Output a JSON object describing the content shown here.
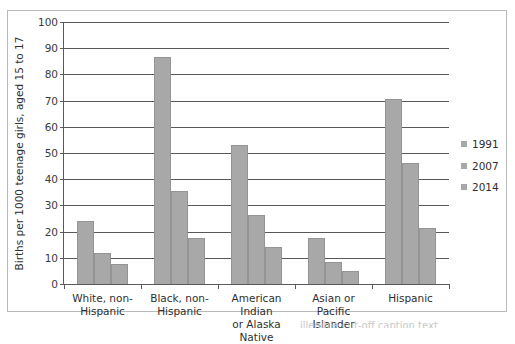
{
  "chart_data": {
    "type": "bar",
    "title": "",
    "xlabel": "",
    "ylabel": "Births per 1000 teenage girls, aged 15 to 17",
    "ylim": [
      0,
      100
    ],
    "ytick_labels": [
      "0",
      "10",
      "20",
      "30",
      "40",
      "50",
      "60",
      "70",
      "80",
      "90",
      "100"
    ],
    "ytick_values": [
      0,
      10,
      20,
      30,
      40,
      50,
      60,
      70,
      80,
      90,
      100
    ],
    "grid": "horizontal",
    "legend_position": "right",
    "bar_color": "#a8a8a8",
    "categories": [
      "White, non-Hispanic",
      "Black, non-Hispanic",
      "American Indian or Alaska Native",
      "Asian or Pacific Islander",
      "Hispanic"
    ],
    "category_lines": [
      [
        "White, non-",
        "Hispanic"
      ],
      [
        "Black, non-",
        "Hispanic"
      ],
      [
        "American Indian",
        "or Alaska Native"
      ],
      [
        "Asian or Pacific",
        "Islander"
      ],
      [
        "Hispanic"
      ]
    ],
    "series": [
      {
        "name": "1991",
        "values": [
          24,
          86.5,
          53,
          17.5,
          70.5
        ]
      },
      {
        "name": "2007",
        "values": [
          12,
          35.5,
          26.5,
          8.5,
          46
        ]
      },
      {
        "name": "2014",
        "values": [
          7.5,
          17.5,
          14,
          5,
          21.5
        ]
      }
    ]
  },
  "legend": {
    "items": [
      {
        "label": "1991"
      },
      {
        "label": "2007"
      },
      {
        "label": "2014"
      }
    ]
  },
  "caption": {
    "clipped_text": "illegible cut-off caption text"
  }
}
